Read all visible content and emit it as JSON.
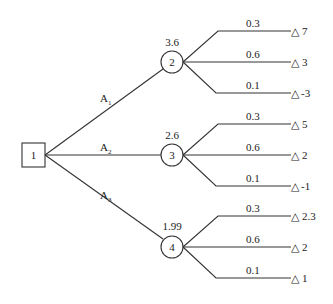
{
  "diagram": {
    "type": "decision-tree",
    "decision_node": {
      "id": "1",
      "shape": "square"
    },
    "alternatives": [
      {
        "label": "A",
        "subscript": "1",
        "chance_node": "2",
        "expected_value": "3.6",
        "branches": [
          {
            "probability": "0.3",
            "payoff": "7"
          },
          {
            "probability": "0.6",
            "payoff": "3"
          },
          {
            "probability": "0.1",
            "payoff": "-3"
          }
        ]
      },
      {
        "label": "A",
        "subscript": "2",
        "chance_node": "3",
        "expected_value": "2.6",
        "branches": [
          {
            "probability": "0.3",
            "payoff": "5"
          },
          {
            "probability": "0.6",
            "payoff": "2"
          },
          {
            "probability": "0.1",
            "payoff": "-1"
          }
        ]
      },
      {
        "label": "A",
        "subscript": "3",
        "chance_node": "4",
        "expected_value": "1.99",
        "branches": [
          {
            "probability": "0.3",
            "payoff": "2.3"
          },
          {
            "probability": "0.6",
            "payoff": "2"
          },
          {
            "probability": "0.1",
            "payoff": "1"
          }
        ]
      }
    ],
    "terminal_symbol": "△",
    "colors": {
      "stroke": "#333333",
      "text": "#222222",
      "background": "#ffffff"
    }
  }
}
